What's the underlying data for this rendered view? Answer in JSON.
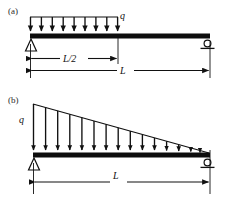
{
  "figure": {
    "type": "structural-beam-diagram",
    "stroke_color": "#111111",
    "beam_color": "#0d0d0d",
    "background": "#ffffff"
  },
  "panels": [
    {
      "id": "a",
      "label": "(a)",
      "load": {
        "symbol": "q",
        "kind": "uniform",
        "extent": "half-span-left",
        "arrow_count": 9,
        "start_x": 30,
        "end_x": 118,
        "top_y": 17,
        "beam_y": 36
      },
      "beam": {
        "x_left": 30,
        "x_right": 210,
        "y": 36,
        "thickness": 5
      },
      "supports": [
        {
          "kind": "pin",
          "position": "left",
          "x": 31,
          "y": 40
        },
        {
          "kind": "roller",
          "position": "right",
          "x": 208,
          "y": 40
        }
      ],
      "dimensions": [
        {
          "label": "L/2",
          "x_start": 30,
          "x_end": 118,
          "y": 59
        },
        {
          "label": "L",
          "x_start": 30,
          "x_end": 210,
          "y": 71
        }
      ]
    },
    {
      "id": "b",
      "label": "(b)",
      "load": {
        "symbol": "q",
        "kind": "triangular",
        "extent": "full-span",
        "peak_side": "left",
        "arrow_count": 15,
        "start_x": 33,
        "end_x": 208,
        "peak_y": 104,
        "beam_y": 155
      },
      "beam": {
        "x_left": 33,
        "x_right": 210,
        "y": 155,
        "thickness": 5
      },
      "supports": [
        {
          "kind": "pin",
          "position": "left",
          "x": 34,
          "y": 159
        },
        {
          "kind": "roller",
          "position": "right",
          "x": 208,
          "y": 159
        }
      ],
      "dimensions": [
        {
          "label": "L",
          "x_start": 33,
          "x_end": 210,
          "y": 177
        }
      ]
    }
  ]
}
